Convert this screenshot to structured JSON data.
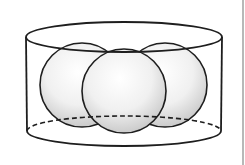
{
  "diagram": {
    "colors": {
      "stroke": "#1e1e1e",
      "sphere_light": "#ffffff",
      "sphere_mid": "#f0f0f0",
      "sphere_dark": "#c4c4c4",
      "background": "#ffffff",
      "edge_line": "#b8b8b8"
    },
    "cylinder": {
      "top_ellipse": {
        "cx": 124,
        "cy": 37,
        "rx": 98,
        "ry": 15
      },
      "bottom_ellipse": {
        "cx": 124,
        "cy": 131,
        "rx": 97,
        "ry": 15,
        "back_half_dashed": true
      },
      "left_x": 26,
      "right_x": 222
    },
    "spheres": [
      {
        "name": "left-back",
        "cx": 82,
        "cy": 85,
        "r": 42
      },
      {
        "name": "right-back",
        "cx": 165,
        "cy": 85,
        "r": 42
      },
      {
        "name": "front-middle",
        "cx": 124,
        "cy": 91,
        "r": 42
      }
    ]
  }
}
